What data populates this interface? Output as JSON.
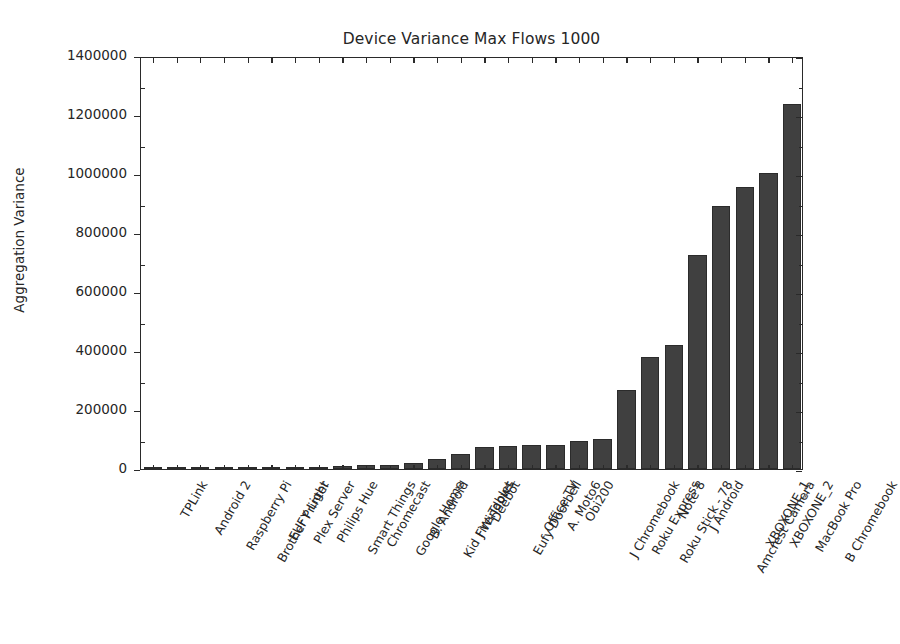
{
  "chart_data": {
    "type": "bar",
    "title": "Device Variance Max Flows 1000",
    "xlabel": "",
    "ylabel": "Aggregation Variance",
    "ylim": [
      0,
      1400000
    ],
    "ytick_labels": [
      "0",
      "200000",
      "400000",
      "600000",
      "800000",
      "1000000",
      "1200000",
      "1400000"
    ],
    "ytick_values": [
      0,
      200000,
      400000,
      600000,
      800000,
      1000000,
      1200000,
      1400000
    ],
    "grid": false,
    "legend": "none",
    "bar_color": "#404040",
    "bar_edge_color": "#2b2b2b",
    "categories": [
      "TPLink",
      "Android 2",
      "Raspberry Pi",
      "Brother Printer",
      "EUFY Light",
      "Plex Server",
      "Philips Hue",
      "Smart Things",
      "Chromecast",
      "Google Home",
      "B. Android",
      "Kid Fire Tablet",
      "J Windows",
      "Deebot",
      "Eufy Doorbell",
      "Office TV",
      "A. Moto6",
      "Obi200",
      "J Chromebook",
      "Roku Express",
      "Roku Stick - 78",
      "Note 8",
      "J Android",
      "Amcrest Camera",
      "XBOXONE_1",
      "XBOXONE_2",
      "MacBook Pro",
      "B Chromebook"
    ],
    "values": [
      300,
      600,
      900,
      1200,
      2500,
      3500,
      4200,
      5000,
      11000,
      12000,
      14000,
      21000,
      34000,
      52000,
      74000,
      79000,
      80000,
      81000,
      94000,
      101000,
      268000,
      380000,
      419000,
      725000,
      893000,
      955000,
      1005000,
      1236000
    ]
  }
}
